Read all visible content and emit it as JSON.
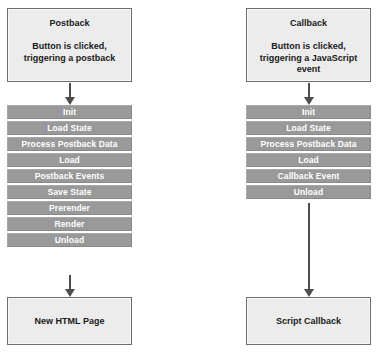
{
  "diagram": {
    "colors": {
      "terminal_fill": "#ececec",
      "terminal_border": "#6e6e6e",
      "step_fill": "#999999",
      "step_text": "#ffffff",
      "arrow": "#4d4d4d",
      "background": "#ffffff"
    },
    "columns": [
      {
        "id": "postback",
        "start": {
          "title": "Postback",
          "body_lines": [
            "Button is clicked,",
            "triggering a postback"
          ],
          "body": "Button is clicked, triggering a postback"
        },
        "steps": [
          "Init",
          "Load State",
          "Process Postback Data",
          "Load",
          "Postback Events",
          "Save State",
          "Prerender",
          "Render",
          "Unload"
        ],
        "end": {
          "title": "New HTML Page"
        }
      },
      {
        "id": "callback",
        "start": {
          "title": "Callback",
          "body_lines": [
            "Button is clicked,",
            "triggering a JavaScript",
            "event"
          ],
          "body": "Button is clicked, triggering a JavaScript event"
        },
        "steps": [
          "Init",
          "Load State",
          "Process Postback Data",
          "Load",
          "Callback Event",
          "Unload"
        ],
        "end": {
          "title": "Script Callback"
        }
      }
    ]
  }
}
